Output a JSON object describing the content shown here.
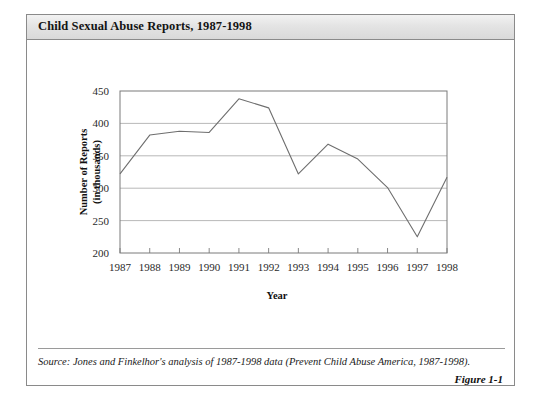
{
  "figure": {
    "title": "Child Sexual Abuse Reports, 1987-1998",
    "source_note": "Source: Jones and Finkelhor's analysis of 1987-1998 data (Prevent Child Abuse America, 1987-1998).",
    "figure_number": "Figure 1-1"
  },
  "chart_data": {
    "type": "line",
    "title": "Child Sexual Abuse Reports, 1987-1998",
    "xlabel": "Year",
    "ylabel": "Number of Reports (in thousands)",
    "ylabel_line1": "Number of Reports",
    "ylabel_line2": "(in thousands)",
    "categories": [
      "1987",
      "1988",
      "1989",
      "1990",
      "1991",
      "1992",
      "1993",
      "1994",
      "1995",
      "1996",
      "1997",
      "1998"
    ],
    "values": [
      322,
      382,
      388,
      386,
      438,
      424,
      322,
      368,
      345,
      301,
      225,
      317
    ],
    "ylim": [
      200,
      450
    ],
    "yticks": [
      200,
      250,
      300,
      350,
      400,
      450
    ],
    "ytick_labels": [
      "200",
      "250",
      "300",
      "350",
      "400",
      "450"
    ],
    "grid": true,
    "legend": "none",
    "series_color": "#6e6e6e"
  }
}
